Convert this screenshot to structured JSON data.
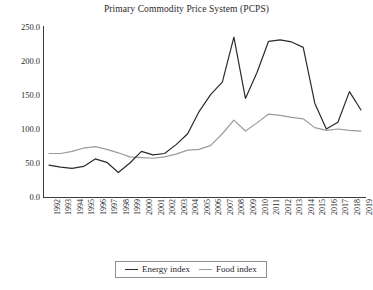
{
  "chart_data": {
    "type": "line",
    "title": "Primary Commodity Price System (PCPS)",
    "xlabel": "",
    "ylabel": "",
    "ylim": [
      0.0,
      250.0
    ],
    "ytick_labels": [
      "250.0",
      "200.0",
      "150.0",
      "100.0",
      "50.0",
      "0.0"
    ],
    "ytick_values": [
      250.0,
      200.0,
      150.0,
      100.0,
      50.0,
      0.0
    ],
    "grid": false,
    "legend_position": "bottom-center",
    "categories": [
      "1992",
      "1993",
      "1994",
      "1995",
      "1996",
      "1997",
      "1998",
      "1999",
      "2000",
      "2001",
      "2002",
      "2003",
      "2004",
      "2005",
      "2006",
      "2007",
      "2008",
      "2009",
      "2010",
      "2011",
      "2012",
      "2013",
      "2014",
      "2015",
      "2016",
      "2017",
      "2018",
      "2019"
    ],
    "series": [
      {
        "name": "Energy index",
        "color": "#2b2b2b",
        "values": [
          47,
          44,
          42,
          45,
          56,
          51,
          36,
          50,
          67,
          62,
          64,
          77,
          93,
          126,
          151,
          169,
          235,
          145,
          183,
          229,
          231,
          228,
          220,
          138,
          100,
          110,
          155,
          128
        ]
      },
      {
        "name": "Food index",
        "color": "#9b9b9b",
        "values": [
          64,
          64,
          67,
          72,
          74,
          70,
          65,
          59,
          58,
          57,
          59,
          63,
          69,
          70,
          76,
          93,
          113,
          97,
          109,
          122,
          120,
          117,
          115,
          102,
          98,
          100,
          98,
          97
        ]
      }
    ]
  },
  "legend": {
    "entries": [
      {
        "label": "Energy index",
        "swatch": "energy-line-swatch"
      },
      {
        "label": "Food index",
        "swatch": "food-line-swatch"
      }
    ]
  }
}
